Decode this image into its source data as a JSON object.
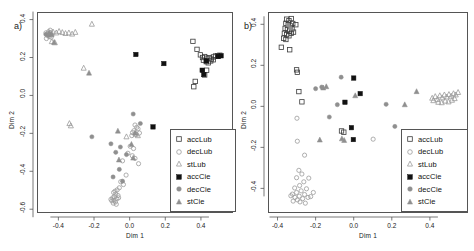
{
  "figure": {
    "type": "two-panel-scatter",
    "panels": [
      {
        "tag": "a)",
        "xlabel": "Dim 1",
        "ylabel": "Dim 2"
      },
      {
        "tag": "b)",
        "xlabel": "Dim 1",
        "ylabel": "Dim 2"
      }
    ],
    "legend_labels": [
      "accLub",
      "decLub",
      "stLub",
      "accCie",
      "decCie",
      "stCie"
    ],
    "colors": {
      "accLub": "#3a3a3a",
      "decLub": "#9a9a9a",
      "stLub": "#9a9a9a",
      "accCie": "#111111",
      "decCie": "#8f8f8f",
      "stCie": "#8f8f8f",
      "frame": "#555555",
      "text": "#1a1a1a",
      "background": "#ffffff"
    }
  },
  "chart_data": [
    {
      "type": "scatter",
      "panel": "a)",
      "title": "",
      "xlabel": "Dim 1",
      "ylabel": "Dim 2",
      "xlim": [
        -0.52,
        0.58
      ],
      "ylim": [
        -0.62,
        0.44
      ],
      "xticks": [
        -0.4,
        -0.2,
        0.0,
        0.2,
        0.4
      ],
      "xticklabels": [
        "-0.4",
        "-0.2",
        "0.0",
        "0.2",
        "0.4"
      ],
      "yticks": [
        0.4,
        0.2,
        0.0,
        -0.2,
        -0.4,
        -0.6
      ],
      "yticklabels": [
        "0.4",
        "0.2",
        "0.0",
        "-0.2",
        "-0.4",
        "-0.6"
      ],
      "grid": false,
      "legend_position": "bottom-right",
      "series": [
        {
          "name": "accLub",
          "marker": "open-square",
          "color": "#3a3a3a",
          "points": [
            [
              0.355,
              0.285
            ],
            [
              0.378,
              0.243
            ],
            [
              0.397,
              0.214
            ],
            [
              0.409,
              0.2
            ],
            [
              0.421,
              0.205
            ],
            [
              0.433,
              0.196
            ],
            [
              0.447,
              0.199
            ],
            [
              0.458,
              0.192
            ],
            [
              0.47,
              0.203
            ],
            [
              0.482,
              0.208
            ],
            [
              0.494,
              0.21
            ],
            [
              0.506,
              0.212
            ],
            [
              0.414,
              0.186
            ],
            [
              0.43,
              0.178
            ],
            [
              0.441,
              0.172
            ],
            [
              0.455,
              0.182
            ],
            [
              0.432,
              0.133
            ],
            [
              0.421,
              0.108
            ],
            [
              0.368,
              0.074
            ],
            [
              0.36,
              0.046
            ],
            [
              0.497,
              0.206
            ],
            [
              0.47,
              0.188
            ]
          ]
        },
        {
          "name": "decLub",
          "marker": "open-circle",
          "color": "#9a9a9a",
          "points": [
            [
              -0.47,
              0.33
            ],
            [
              -0.462,
              0.325
            ],
            [
              -0.455,
              0.336
            ],
            [
              -0.449,
              0.321
            ],
            [
              -0.443,
              0.331
            ],
            [
              -0.437,
              0.318
            ],
            [
              -0.452,
              0.31
            ],
            [
              -0.46,
              0.316
            ],
            [
              -0.446,
              0.344
            ],
            [
              -0.44,
              0.307
            ],
            [
              -0.467,
              0.3
            ],
            [
              0.03,
              -0.156
            ],
            [
              0.04,
              -0.168
            ],
            [
              0.047,
              -0.176
            ],
            [
              0.024,
              -0.186
            ],
            [
              0.016,
              -0.196
            ],
            [
              0.055,
              -0.198
            ],
            [
              0.036,
              -0.205
            ],
            [
              0.012,
              -0.212
            ],
            [
              0.003,
              -0.268
            ],
            [
              0.022,
              -0.28
            ],
            [
              -0.01,
              -0.305
            ],
            [
              0.015,
              -0.318
            ],
            [
              0.03,
              -0.332
            ],
            [
              -0.04,
              -0.345
            ],
            [
              0.05,
              -0.36
            ],
            [
              -0.02,
              -0.42
            ],
            [
              -0.05,
              -0.455
            ],
            [
              -0.035,
              -0.47
            ],
            [
              -0.058,
              -0.487
            ],
            [
              -0.07,
              -0.498
            ],
            [
              -0.082,
              -0.505
            ],
            [
              -0.09,
              -0.512
            ],
            [
              -0.078,
              -0.52
            ],
            [
              -0.065,
              -0.528
            ],
            [
              -0.086,
              -0.534
            ],
            [
              -0.095,
              -0.54
            ],
            [
              -0.072,
              -0.545
            ],
            [
              -0.088,
              -0.552
            ],
            [
              -0.1,
              -0.556
            ],
            [
              -0.08,
              -0.562
            ],
            [
              -0.092,
              -0.568
            ],
            [
              -0.105,
              -0.548
            ],
            [
              -0.062,
              -0.54
            ],
            [
              -0.075,
              -0.574
            ]
          ]
        },
        {
          "name": "stLub",
          "marker": "open-triangle",
          "color": "#9a9a9a",
          "points": [
            [
              -0.43,
              0.335
            ],
            [
              -0.412,
              0.33
            ],
            [
              -0.396,
              0.338
            ],
            [
              -0.378,
              0.332
            ],
            [
              -0.36,
              0.327
            ],
            [
              -0.341,
              0.33
            ],
            [
              -0.323,
              0.324
            ],
            [
              -0.305,
              0.333
            ],
            [
              -0.212,
              0.376
            ],
            [
              -0.437,
              0.284
            ],
            [
              -0.42,
              0.278
            ],
            [
              -0.258,
              0.144
            ],
            [
              -0.338,
              -0.148
            ],
            [
              -0.33,
              -0.16
            ],
            [
              0.035,
              -0.204
            ],
            [
              0.046,
              -0.212
            ],
            [
              -0.018,
              -0.218
            ]
          ]
        },
        {
          "name": "accCie",
          "marker": "filled-square",
          "color": "#111111",
          "points": [
            [
              0.035,
              0.216
            ],
            [
              0.192,
              0.168
            ],
            [
              0.407,
              0.133
            ],
            [
              0.416,
              0.11
            ],
            [
              0.43,
              0.182
            ],
            [
              0.497,
              0.206
            ],
            [
              0.513,
              0.209
            ],
            [
              0.131,
              -0.166
            ]
          ]
        },
        {
          "name": "decCie",
          "marker": "filled-circle",
          "color": "#8f8f8f",
          "points": [
            [
              0.02,
              -0.098
            ],
            [
              0.06,
              -0.148
            ],
            [
              -0.212,
              -0.218
            ],
            [
              -0.105,
              -0.255
            ],
            [
              -0.052,
              -0.272
            ],
            [
              -0.078,
              -0.3
            ],
            [
              -0.018,
              -0.312
            ],
            [
              -0.058,
              -0.39
            ],
            [
              -0.093,
              -0.43
            ],
            [
              -0.04,
              -0.452
            ],
            [
              -0.47,
              0.322
            ],
            [
              -0.455,
              0.318
            ]
          ]
        },
        {
          "name": "stCie",
          "marker": "filled-triangle",
          "color": "#8f8f8f",
          "points": [
            [
              -0.228,
              0.118
            ],
            [
              -0.452,
              0.33
            ],
            [
              -0.438,
              0.322
            ],
            [
              -0.424,
              0.28
            ],
            [
              -0.066,
              -0.188
            ],
            [
              0.03,
              -0.198
            ],
            [
              0.01,
              -0.258
            ],
            [
              0.02,
              -0.33
            ],
            [
              -0.06,
              -0.34
            ]
          ]
        }
      ]
    },
    {
      "type": "scatter",
      "panel": "b)",
      "title": "",
      "xlabel": "Dim 1",
      "ylabel": "Dim 2",
      "xlim": [
        -0.45,
        0.6
      ],
      "ylim": [
        -0.52,
        0.46
      ],
      "xticks": [
        -0.4,
        -0.2,
        0.0,
        0.2,
        0.4
      ],
      "xticklabels": [
        "-0.4",
        "-0.2",
        "0.0",
        "0.2",
        "0.4"
      ],
      "yticks": [
        0.4,
        0.2,
        0.0,
        -0.2,
        -0.4
      ],
      "yticklabels": [
        "0.4",
        "0.2",
        "0.0",
        "-0.2",
        "-0.4"
      ],
      "grid": false,
      "legend_position": "bottom-right",
      "series": [
        {
          "name": "accLub",
          "marker": "open-square",
          "color": "#3a3a3a",
          "points": [
            [
              -0.352,
              0.425
            ],
            [
              -0.34,
              0.418
            ],
            [
              -0.328,
              0.428
            ],
            [
              -0.356,
              0.405
            ],
            [
              -0.344,
              0.398
            ],
            [
              -0.332,
              0.392
            ],
            [
              -0.32,
              0.404
            ],
            [
              -0.36,
              0.38
            ],
            [
              -0.348,
              0.374
            ],
            [
              -0.336,
              0.368
            ],
            [
              -0.324,
              0.378
            ],
            [
              -0.364,
              0.356
            ],
            [
              -0.352,
              0.35
            ],
            [
              -0.34,
              0.344
            ],
            [
              -0.328,
              0.356
            ],
            [
              -0.316,
              0.362
            ],
            [
              -0.304,
              0.398
            ],
            [
              -0.368,
              0.332
            ],
            [
              -0.356,
              0.326
            ],
            [
              -0.38,
              0.288
            ],
            [
              -0.336,
              0.276
            ],
            [
              -0.3,
              0.178
            ],
            [
              -0.296,
              0.166
            ],
            [
              -0.288,
              0.072
            ],
            [
              -0.272,
              0.022
            ],
            [
              -0.064,
              -0.12
            ],
            [
              -0.052,
              -0.126
            ]
          ]
        },
        {
          "name": "decLub",
          "marker": "open-circle",
          "color": "#9a9a9a",
          "points": [
            [
              -0.298,
              -0.058
            ],
            [
              -0.296,
              -0.17
            ],
            [
              -0.258,
              -0.238
            ],
            [
              -0.288,
              -0.312
            ],
            [
              -0.272,
              -0.33
            ],
            [
              -0.3,
              -0.348
            ],
            [
              -0.236,
              -0.35
            ],
            [
              -0.262,
              -0.368
            ],
            [
              -0.284,
              -0.386
            ],
            [
              -0.31,
              -0.398
            ],
            [
              -0.248,
              -0.402
            ],
            [
              -0.276,
              -0.412
            ],
            [
              -0.3,
              -0.42
            ],
            [
              -0.322,
              -0.428
            ],
            [
              -0.258,
              -0.43
            ],
            [
              -0.286,
              -0.438
            ],
            [
              -0.308,
              -0.444
            ],
            [
              -0.33,
              -0.436
            ],
            [
              -0.268,
              -0.45
            ],
            [
              -0.296,
              -0.456
            ],
            [
              -0.24,
              -0.444
            ],
            [
              -0.318,
              -0.462
            ],
            [
              -0.282,
              -0.466
            ],
            [
              -0.254,
              -0.472
            ],
            [
              0.102,
              -0.16
            ],
            [
              -0.212,
              -0.42
            ],
            [
              -0.226,
              -0.44
            ]
          ]
        },
        {
          "name": "stLub",
          "marker": "open-triangle",
          "color": "#9a9a9a",
          "points": [
            [
              0.412,
              0.04
            ],
            [
              0.428,
              0.048
            ],
            [
              0.44,
              0.034
            ],
            [
              0.452,
              0.052
            ],
            [
              0.464,
              0.042
            ],
            [
              0.476,
              0.056
            ],
            [
              0.488,
              0.046
            ],
            [
              0.5,
              0.058
            ],
            [
              0.512,
              0.05
            ],
            [
              0.524,
              0.062
            ],
            [
              0.536,
              0.056
            ],
            [
              0.548,
              0.068
            ],
            [
              0.444,
              0.02
            ],
            [
              0.462,
              0.018
            ],
            [
              0.48,
              0.026
            ],
            [
              0.498,
              0.022
            ],
            [
              0.516,
              0.03
            ],
            [
              0.53,
              0.038
            ],
            [
              0.418,
              0.028
            ]
          ]
        },
        {
          "name": "accCie",
          "marker": "filled-square",
          "color": "#111111",
          "points": [
            [
              0.0,
              0.138
            ],
            [
              0.034,
              0.062
            ],
            [
              -0.046,
              0.02
            ],
            [
              -0.012,
              -0.104
            ],
            [
              -0.002,
              -0.162
            ]
          ]
        },
        {
          "name": "decCie",
          "marker": "filled-circle",
          "color": "#8f8f8f",
          "points": [
            [
              -0.066,
              0.142
            ],
            [
              -0.2,
              0.086
            ],
            [
              -0.168,
              0.094
            ],
            [
              -0.086,
              0.008
            ],
            [
              -0.128,
              -0.052
            ],
            [
              0.17,
              0.01
            ],
            [
              0.216,
              -0.098
            ],
            [
              -0.344,
              0.396
            ],
            [
              -0.332,
              0.38
            ]
          ]
        },
        {
          "name": "stCie",
          "marker": "filled-triangle",
          "color": "#8f8f8f",
          "points": [
            [
              -0.16,
              0.09
            ],
            [
              -0.144,
              0.096
            ],
            [
              0.008,
              0.052
            ],
            [
              0.268,
              0.008
            ],
            [
              0.33,
              0.072
            ],
            [
              -0.178,
              -0.164
            ],
            [
              -0.062,
              -0.158
            ],
            [
              -0.05,
              -0.166
            ]
          ]
        }
      ]
    }
  ]
}
